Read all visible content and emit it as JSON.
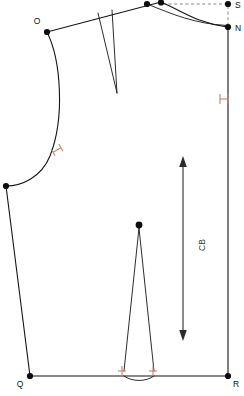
{
  "document": {
    "title": "Back Bodice Pattern Piece",
    "canvas": {
      "width": 244,
      "height": 396
    },
    "background_color": "#ffffff"
  },
  "colors": {
    "seam_line": "#141414",
    "notch": "#c88070",
    "guide_line": "#6b6b6b",
    "vertex": "#0d0d0d",
    "grain_arrow": "#2a2a2a",
    "label_text": "#111111"
  },
  "labels": {
    "point_o": "O",
    "point_s": "S",
    "point_n": "N",
    "point_q": "Q",
    "point_r": "R",
    "grainline": "CB"
  },
  "points": [
    {
      "id": "point-o",
      "label": "O",
      "x": 47,
      "y": 32,
      "label_x": 36,
      "label_y": 24
    },
    {
      "id": "point-neck-inner",
      "label": "",
      "x": 147,
      "y": 4,
      "label_x": 0,
      "label_y": 0
    },
    {
      "id": "point-neck-outer",
      "label": "",
      "x": 161,
      "y": 2,
      "label_x": 0,
      "label_y": 0
    },
    {
      "id": "point-s",
      "label": "S",
      "x": 228,
      "y": 4,
      "label_x": 234,
      "label_y": 8
    },
    {
      "id": "point-n",
      "label": "N",
      "x": 228,
      "y": 27,
      "label_x": 234,
      "label_y": 31
    },
    {
      "id": "point-underarm",
      "label": "",
      "x": 6,
      "y": 186,
      "label_x": 0,
      "label_y": 0
    },
    {
      "id": "point-dart-apex",
      "label": "",
      "x": 139,
      "y": 225,
      "label_x": 0,
      "label_y": 0
    },
    {
      "id": "point-q",
      "label": "Q",
      "x": 30,
      "y": 376,
      "label_x": 19,
      "label_y": 386
    },
    {
      "id": "point-r",
      "label": "R",
      "x": 228,
      "y": 376,
      "label_x": 234,
      "label_y": 386
    }
  ],
  "notches": [
    {
      "id": "notch-armhole",
      "type": "double-bar",
      "x": 57,
      "y": 150,
      "rotation": -32
    },
    {
      "id": "notch-centre-back",
      "type": "double-bar",
      "x": 224,
      "y": 99,
      "rotation": 0
    },
    {
      "id": "notch-dart-left",
      "type": "single-bar",
      "x": 122,
      "y": 371,
      "rotation": 0
    },
    {
      "id": "notch-dart-right",
      "type": "single-bar",
      "x": 153,
      "y": 371,
      "rotation": 0
    }
  ],
  "grainline": {
    "label": "CB",
    "orientation": "vertical",
    "double_headed": true,
    "x": 183,
    "y_top": 158,
    "y_bottom": 339,
    "label_x": 203,
    "label_y": 243
  },
  "geometry": {
    "shoulder_seam": "M47,32 L161,2",
    "neckline_outer": "M161,2 C183,12 199,24 228,27",
    "neckline_inner": "M147,4 C173,15 196,25 228,26",
    "centre_back_line": "M228,27 L228,376",
    "hem_line": "M30,376 L228,376",
    "side_seam": "M6,186 L30,376",
    "armhole_curve": "M47,32 C62,62 65,120 49,158 C39,180 20,186 6,186",
    "shoulder_dart_left": "M98,13 L116,92",
    "shoulder_dart_right": "M111,10 L117,92",
    "waist_dart_left": "M139,227 L125,371",
    "waist_dart_right": "M139,227 L153,371",
    "waist_dart_hem_curve": "M125,371 C132,378 146,378 153,371",
    "guide_dashed": "M161,4 L228,4 M228,4 L228,27"
  }
}
